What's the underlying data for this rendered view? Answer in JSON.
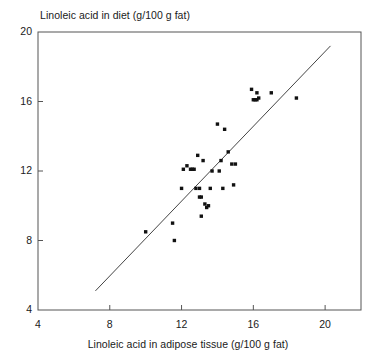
{
  "chart_data": {
    "type": "scatter",
    "title": "Linoleic acid in diet (g/100 g fat)",
    "xlabel": "Linoleic acid in adipose tissue (g/100 g fat)",
    "ylabel": "",
    "xlim": [
      4,
      22
    ],
    "ylim": [
      4,
      20
    ],
    "xticks": [
      4,
      8,
      12,
      16,
      20
    ],
    "yticks": [
      4,
      8,
      12,
      16,
      20
    ],
    "xtick_labels": [
      "4",
      "8",
      "12",
      "16",
      "20"
    ],
    "ytick_labels": [
      "4",
      "8",
      "12",
      "16",
      "20"
    ],
    "grid": false,
    "legend": false,
    "marker_shape": "square",
    "marker_color": "#111111",
    "series": [
      {
        "name": "observations",
        "x": [
          10.0,
          11.5,
          11.6,
          12.0,
          12.1,
          12.3,
          12.5,
          12.6,
          12.7,
          12.8,
          12.9,
          13.0,
          13.0,
          13.1,
          13.1,
          13.2,
          13.3,
          13.4,
          13.5,
          13.6,
          13.7,
          14.0,
          14.1,
          14.2,
          14.3,
          14.4,
          14.6,
          14.8,
          14.9,
          15.0,
          15.9,
          16.0,
          16.1,
          16.2,
          16.2,
          16.3,
          17.0,
          18.4
        ],
        "y": [
          8.5,
          9.0,
          8.0,
          11.0,
          12.1,
          12.3,
          12.1,
          12.1,
          12.1,
          11.0,
          12.9,
          10.5,
          11.0,
          10.5,
          9.4,
          12.6,
          10.1,
          9.9,
          10.0,
          11.0,
          12.0,
          14.7,
          12.0,
          12.6,
          11.0,
          14.4,
          13.1,
          12.4,
          11.2,
          12.4,
          16.7,
          16.1,
          16.1,
          16.5,
          16.1,
          16.2,
          16.5,
          16.2
        ]
      }
    ],
    "fit_line": {
      "name": "regression-line",
      "x_start": 7.2,
      "y_start": 5.1,
      "x_end": 20.3,
      "y_end": 19.2,
      "color": "#444444"
    }
  },
  "axes": {
    "frame_color": "#555555"
  }
}
